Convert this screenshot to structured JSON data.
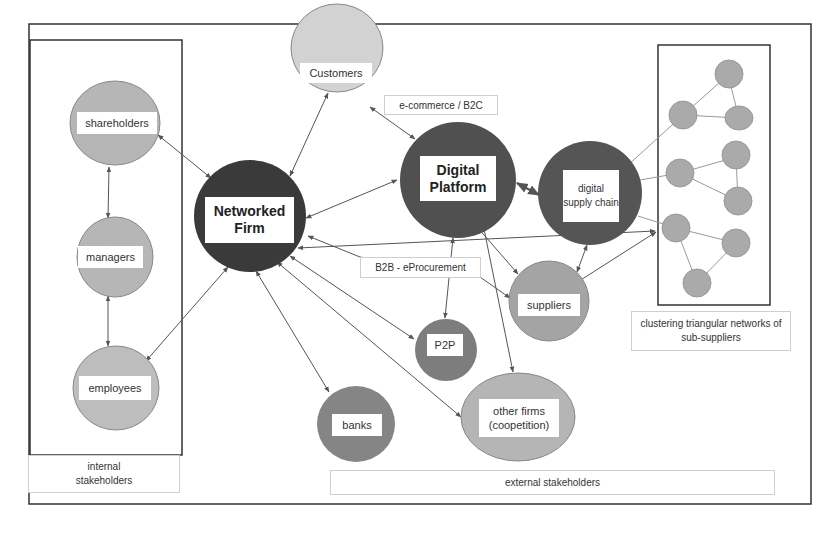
{
  "diagram": {
    "title": "",
    "colors": {
      "core_dark": "#3a3a3a",
      "dark_node": "#565656",
      "mid_node": "#8a8a8a",
      "light_node": "#b4b4b4",
      "lighter_node": "#cdcdcd",
      "sub_node": "#a9a9a9",
      "edge": "#555555",
      "frame": "#333333"
    },
    "nodes": {
      "customers": "Customers",
      "shareholders": "shareholders",
      "managers": "managers",
      "employees": "employees",
      "networked_firm": "Networked Firm",
      "digital_platform": "Digital Platform",
      "digital_supply_chain": "digital supply chain",
      "suppliers": "suppliers",
      "p2p": "P2P",
      "banks": "banks",
      "other_firms": "other firms (coopetition)"
    },
    "edge_labels": {
      "ecommerce": "e-commerce / B2C",
      "b2b": "B2B - eProcurement"
    },
    "groups": {
      "internal": "internal stakeholders",
      "external": "external stakeholders",
      "sub_suppliers": "clustering triangular networks of sub-suppliers"
    },
    "edges": [
      {
        "from": "shareholders",
        "to": "managers",
        "type": "bidirectional"
      },
      {
        "from": "managers",
        "to": "employees",
        "type": "bidirectional"
      },
      {
        "from": "shareholders",
        "to": "networked_firm",
        "type": "bidirectional"
      },
      {
        "from": "employees",
        "to": "networked_firm",
        "type": "bidirectional"
      },
      {
        "from": "customers",
        "to": "networked_firm",
        "type": "bidirectional"
      },
      {
        "from": "customers",
        "to": "digital_platform",
        "type": "bidirectional"
      },
      {
        "from": "networked_firm",
        "to": "digital_platform",
        "type": "bidirectional"
      },
      {
        "from": "digital_platform",
        "to": "digital_supply_chain",
        "type": "bidirectional"
      },
      {
        "from": "networked_firm",
        "to": "sub_suppliers",
        "type": "bidirectional"
      },
      {
        "from": "networked_firm",
        "to": "suppliers",
        "type": "directed"
      },
      {
        "from": "networked_firm",
        "to": "p2p",
        "type": "bidirectional"
      },
      {
        "from": "networked_firm",
        "to": "banks",
        "type": "bidirectional"
      },
      {
        "from": "networked_firm",
        "to": "other_firms",
        "type": "bidirectional"
      },
      {
        "from": "digital_platform",
        "to": "p2p",
        "type": "bidirectional"
      },
      {
        "from": "digital_platform",
        "to": "suppliers",
        "type": "bidirectional"
      },
      {
        "from": "digital_platform",
        "to": "other_firms",
        "type": "directed"
      },
      {
        "from": "digital_supply_chain",
        "to": "suppliers",
        "type": "bidirectional"
      },
      {
        "from": "sub_suppliers",
        "to": "suppliers",
        "type": "bidirectional"
      },
      {
        "from": "digital_supply_chain",
        "to": "sub_suppliers",
        "type": "line"
      }
    ]
  }
}
